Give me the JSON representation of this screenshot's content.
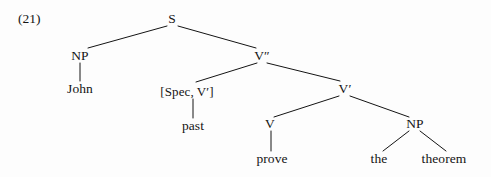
{
  "figure": {
    "example_number": "(21)",
    "width": 491,
    "height": 177,
    "background_color": "#fdfdfd",
    "ink_color": "#141414"
  },
  "tree": {
    "nodes": {
      "s": {
        "label": "S",
        "x": 172,
        "y": 19
      },
      "np_subject": {
        "label": "NP",
        "x": 80,
        "y": 56
      },
      "john": {
        "label": "John",
        "x": 80,
        "y": 89
      },
      "v_double_prime": {
        "label": "V″",
        "x": 262,
        "y": 56
      },
      "spec_v_prime": {
        "label": "[Spec, V′]",
        "x": 187,
        "y": 91
      },
      "past": {
        "label": "past",
        "x": 193,
        "y": 126
      },
      "v_prime": {
        "label": "V′",
        "x": 345,
        "y": 89
      },
      "v_head": {
        "label": "V",
        "x": 270,
        "y": 124
      },
      "prove": {
        "label": "prove",
        "x": 272,
        "y": 159
      },
      "np_object": {
        "label": "NP",
        "x": 415,
        "y": 124
      },
      "the": {
        "label": "the",
        "x": 379,
        "y": 159
      },
      "theorem": {
        "label": "theorem",
        "x": 444,
        "y": 159
      }
    },
    "edges": [
      {
        "name": "s-to-np-subject",
        "x1": 167,
        "y1": 26,
        "x2": 88,
        "y2": 48
      },
      {
        "name": "s-to-v-double-prime",
        "x1": 178,
        "y1": 26,
        "x2": 256,
        "y2": 48
      },
      {
        "name": "np-subject-to-john",
        "x1": 80,
        "y1": 63,
        "x2": 80,
        "y2": 81
      },
      {
        "name": "v-double-prime-to-spec",
        "x1": 257,
        "y1": 63,
        "x2": 196,
        "y2": 82
      },
      {
        "name": "v-double-prime-to-v-prime",
        "x1": 267,
        "y1": 63,
        "x2": 340,
        "y2": 81
      },
      {
        "name": "spec-to-past",
        "x1": 193,
        "y1": 99,
        "x2": 193,
        "y2": 118
      },
      {
        "name": "v-prime-to-v-head",
        "x1": 339,
        "y1": 96,
        "x2": 274,
        "y2": 117
      },
      {
        "name": "v-prime-to-np-object",
        "x1": 350,
        "y1": 96,
        "x2": 409,
        "y2": 117
      },
      {
        "name": "v-head-to-prove",
        "x1": 271,
        "y1": 131,
        "x2": 271,
        "y2": 151
      },
      {
        "name": "np-object-to-the",
        "x1": 409,
        "y1": 131,
        "x2": 383,
        "y2": 151
      },
      {
        "name": "np-object-to-theorem",
        "x1": 420,
        "y1": 131,
        "x2": 446,
        "y2": 151
      }
    ]
  }
}
